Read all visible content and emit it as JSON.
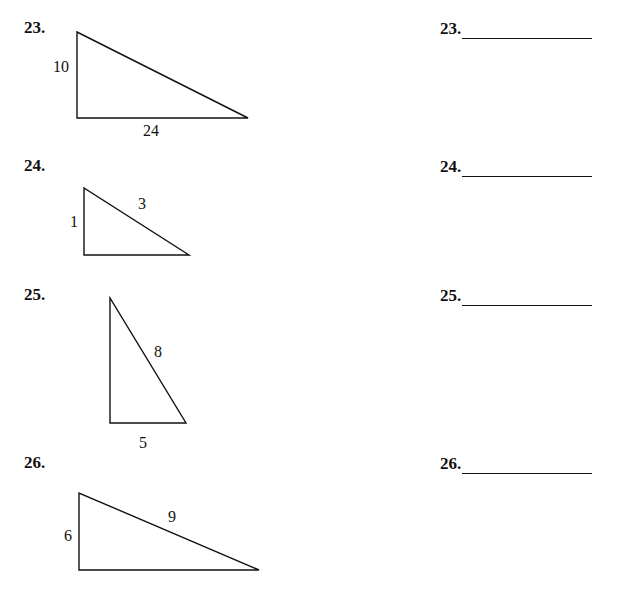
{
  "problems": [
    {
      "number": "23.",
      "answer_label": "23.",
      "labels": {
        "leg_vertical": "10",
        "leg_horizontal": "24"
      }
    },
    {
      "number": "24.",
      "answer_label": "24.",
      "labels": {
        "leg_vertical": "1",
        "hypotenuse": "3"
      }
    },
    {
      "number": "25.",
      "answer_label": "25.",
      "labels": {
        "hypotenuse": "8",
        "leg_horizontal": "5"
      }
    },
    {
      "number": "26.",
      "answer_label": "26.",
      "labels": {
        "leg_vertical": "6",
        "hypotenuse": "9"
      }
    }
  ]
}
